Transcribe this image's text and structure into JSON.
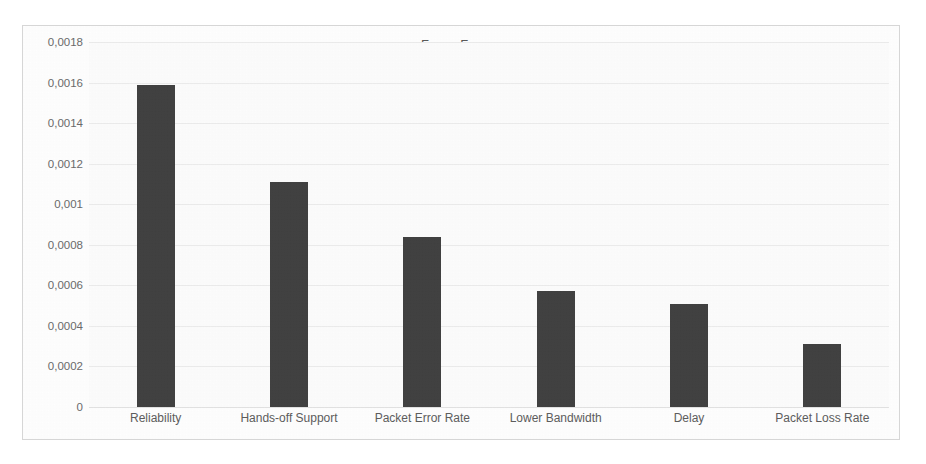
{
  "chart_data": {
    "type": "bar",
    "title": "Fuzzy Fucom",
    "xlabel": "",
    "ylabel": "",
    "categories": [
      "Reliability",
      "Hands-off Support",
      "Packet Error Rate",
      "Lower Bandwidth",
      "Delay",
      "Packet Loss Rate"
    ],
    "values": [
      0.00159,
      0.00111,
      0.00084,
      0.00057,
      0.00051,
      0.00031
    ],
    "ylim": [
      0,
      0.0018
    ],
    "ytick_labels": [
      "0",
      "0,0002",
      "0,0004",
      "0,0006",
      "0,0008",
      "0,001",
      "0,0012",
      "0,0014",
      "0,0016",
      "0,0018"
    ],
    "ytick_values": [
      0,
      0.0002,
      0.0004,
      0.0006,
      0.0008,
      0.001,
      0.0012,
      0.0014,
      0.0016,
      0.0018
    ],
    "grid": true,
    "legend": false,
    "decimal_separator": ",",
    "bar_color": "#414141",
    "plot_background": "#fcfcfc",
    "frame_border_color": "#d6d6d6",
    "title_color": "#5a5a5a",
    "tick_label_color": "#6b6b6b"
  }
}
